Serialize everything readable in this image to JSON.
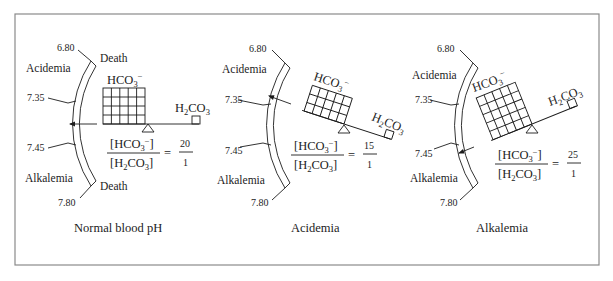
{
  "figure": {
    "frame_color": "#8a8a8a",
    "ink_color": "#1c1c1c",
    "panels": [
      {
        "id": "normal",
        "caption": "Normal blood pH",
        "scale_ticks": [
          "6.80",
          "7.35",
          "7.45",
          "7.80"
        ],
        "zone_labels": {
          "top": "Acidemia",
          "bottom": "Alkalemia"
        },
        "end_labels": {
          "top": "Death",
          "bottom": "Death"
        },
        "bicarbonate_label": "HCO3−",
        "carbonic_acid_label": "H2CO3",
        "ratio": {
          "numerator_text": "[HCO3−]",
          "denominator_text": "[H2CO3]",
          "numerator_value": "20",
          "denominator_value": "1"
        },
        "indicator_position": "normal range (7.35–7.45)",
        "balance_tilt": "level",
        "grid": {
          "rows": 4,
          "cols": 5
        }
      },
      {
        "id": "acidemia",
        "caption": "Acidemia",
        "scale_ticks": [
          "6.80",
          "7.35",
          "7.45",
          "7.80"
        ],
        "zone_labels": {
          "top": "Acidemia",
          "bottom": "Alkalemia"
        },
        "bicarbonate_label": "HCO3−",
        "carbonic_acid_label": "H2CO3",
        "ratio": {
          "numerator_text": "[HCO3−]",
          "denominator_text": "[H2CO3]",
          "numerator_value": "15",
          "denominator_value": "1"
        },
        "indicator_position": "below 7.35",
        "balance_tilt": "H2CO3 side down",
        "grid": {
          "rows": 3,
          "cols": 5
        }
      },
      {
        "id": "alkalemia",
        "caption": "Alkalemia",
        "scale_ticks": [
          "6.80",
          "7.35",
          "7.45",
          "7.80"
        ],
        "zone_labels": {
          "top": "Acidemia",
          "bottom": "Alkalemia"
        },
        "bicarbonate_label": "HCO3−",
        "carbonic_acid_label": "H2CO3",
        "ratio": {
          "numerator_text": "[HCO3−]",
          "denominator_text": "[H2CO3]",
          "numerator_value": "25",
          "denominator_value": "1"
        },
        "indicator_position": "above 7.45",
        "balance_tilt": "HCO3− side down",
        "grid": {
          "rows": 5,
          "cols": 5
        }
      }
    ]
  }
}
